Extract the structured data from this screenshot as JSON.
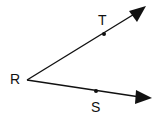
{
  "diagram": {
    "type": "angle",
    "vertex": {
      "label": "R",
      "x": 26,
      "y": 80
    },
    "rays": [
      {
        "name": "ray-RT",
        "point_label": "T",
        "point": {
          "x": 104,
          "y": 34
        },
        "end": {
          "x": 146,
          "y": 6
        }
      },
      {
        "name": "ray-RS",
        "point_label": "S",
        "point": {
          "x": 96,
          "y": 91
        },
        "end": {
          "x": 152,
          "y": 98
        }
      }
    ],
    "labels": {
      "R": "R",
      "T": "T",
      "S": "S"
    },
    "colors": {
      "stroke": "#111111",
      "background": "#ffffff"
    }
  }
}
